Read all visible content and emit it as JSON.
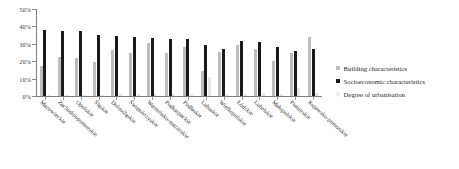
{
  "chart_data": {
    "type": "bar",
    "title": "",
    "subtitle": "",
    "xlabel": "",
    "ylabel": "",
    "ylim": [
      0,
      50
    ],
    "ytick_labels": [
      "0%",
      "10%",
      "20%",
      "30%",
      "40%",
      "50%"
    ],
    "ytick_values": [
      0,
      10,
      20,
      30,
      40,
      50
    ],
    "grid": false,
    "legend_position": "right",
    "value_suffix": "%",
    "categories": [
      "Mazowieckie",
      "Zachodniopomorskie",
      "Opolskie",
      "Śląskie",
      "Dolnośląskie",
      "Świętokrzyskie",
      "Warmińsko-mazurskie",
      "Podkarpackie",
      "Podlaskie",
      "Lubuskie",
      "Wielkopolskie",
      "Łódzkie",
      "Lubelskie",
      "Małopolskie",
      "Pomorskie",
      "Kujawsko-pomorskie"
    ],
    "series": [
      {
        "name": "Building characteristics",
        "color": "#bdbdbd",
        "values": [
          17.5,
          22.3,
          21.7,
          19.4,
          26.6,
          24.8,
          30.6,
          24.8,
          28.2,
          14.5,
          25.3,
          29.2,
          26.8,
          20.3,
          24.5,
          33.9
        ]
      },
      {
        "name": "Socioeconomic characteristics",
        "color": "#1a1a1a",
        "values": [
          38.1,
          37.4,
          37.2,
          35.2,
          34.4,
          33.9,
          33.4,
          32.8,
          32.6,
          29.3,
          27.0,
          31.4,
          31.2,
          27.9,
          25.8,
          26.9
        ]
      },
      {
        "name": "Degree of urbanisation",
        "color": "#e6e6e6",
        "values": [
          0.6,
          0.5,
          0.5,
          0.6,
          1.1,
          1.0,
          1.2,
          1.0,
          1.1,
          10.7,
          1.4,
          1.2,
          1.5,
          1.3,
          4.6,
          1.6
        ]
      }
    ]
  },
  "legend": {
    "items": [
      {
        "label": "Building characteristics"
      },
      {
        "label": "Socioeconomic characteristics"
      },
      {
        "label": "Degree of urbanisation"
      }
    ]
  }
}
